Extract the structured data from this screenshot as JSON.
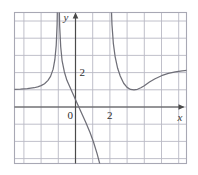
{
  "figure": {
    "background_color": "#ffffff",
    "grid_color": "#b9b9c4",
    "border_color": "#a8a8b4",
    "axis_color": "#4a4a4a",
    "curve_color": "#6f6f78",
    "label_color": "#2e2e2e"
  },
  "axes": {
    "x_axis_label": "x",
    "y_axis_label": "y",
    "origin_label": "0",
    "x_tick_label": "2",
    "y_tick_label": "2"
  },
  "chart_data": {
    "type": "line",
    "title": "",
    "xlabel": "x",
    "ylabel": "y",
    "grid": true,
    "legend": "none",
    "xlim": [
      -3.6,
      6.5
    ],
    "ylim": [
      -5.6,
      3.3
    ],
    "x_ticks": [
      0,
      2
    ],
    "y_ticks": [
      2
    ],
    "origin": "0",
    "asymptotes": {
      "vertical": [
        -1,
        2
      ],
      "horizontal": [
        1
      ]
    },
    "annotations": [
      {
        "text": "local minimum on right branch",
        "x": 3.4,
        "y": 1.1
      }
    ],
    "series": [
      {
        "name": "branch-left",
        "comment": "x < -1 : rises from horizontal asymptote y=1 up to +infinity at x=-1",
        "x": [
          -3.6,
          -3.2,
          -2.8,
          -2.4,
          -2.2,
          -2.0,
          -1.8,
          -1.6,
          -1.45,
          -1.3,
          -1.2,
          -1.12,
          -1.07,
          -1.04
        ],
        "y": [
          1.02,
          1.04,
          1.07,
          1.12,
          1.17,
          1.24,
          1.35,
          1.55,
          1.78,
          2.2,
          2.75,
          3.6,
          4.8,
          6.5
        ]
      },
      {
        "name": "branch-middle",
        "comment": "-1 < x < 2 : falls from +infinity through the origin region down to -infinity at x=2",
        "x": [
          -0.96,
          -0.92,
          -0.86,
          -0.78,
          -0.65,
          -0.5,
          -0.3,
          -0.1,
          0.1,
          0.35,
          0.6,
          0.85,
          1.05,
          1.25,
          1.45,
          1.6,
          1.72,
          1.82,
          1.89,
          1.94
        ],
        "y": [
          6.5,
          4.7,
          3.5,
          2.7,
          2.05,
          1.55,
          1.1,
          0.65,
          0.2,
          -0.35,
          -0.9,
          -1.5,
          -2.05,
          -2.7,
          -3.45,
          -4.1,
          -4.75,
          -5.4,
          -6.0,
          -6.6
        ]
      },
      {
        "name": "branch-right",
        "comment": "x > 2 : falls from +infinity to a local minimum near x=3.4, then rises toward horizontal asymptote y=1",
        "x": [
          2.06,
          2.12,
          2.2,
          2.3,
          2.45,
          2.6,
          2.8,
          3.0,
          3.2,
          3.4,
          3.6,
          3.8,
          4.0,
          4.3,
          4.6,
          5.0,
          5.4,
          5.8,
          6.2,
          6.5
        ],
        "y": [
          6.5,
          4.8,
          3.7,
          2.95,
          2.25,
          1.8,
          1.38,
          1.14,
          1.02,
          0.99,
          1.03,
          1.12,
          1.24,
          1.45,
          1.63,
          1.82,
          1.95,
          2.04,
          2.1,
          2.13
        ]
      }
    ]
  }
}
